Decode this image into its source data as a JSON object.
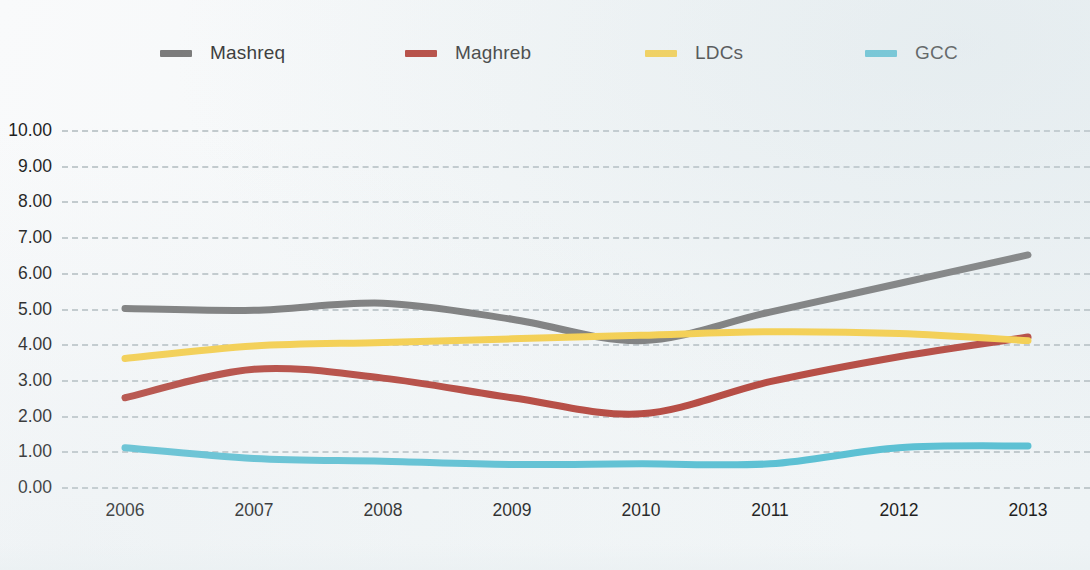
{
  "chart_data": {
    "type": "line",
    "title": "",
    "subtitle": "",
    "xlabel": "",
    "ylabel": "",
    "categories": [
      "2006",
      "2007",
      "2008",
      "2009",
      "2010",
      "2011",
      "2012",
      "2013"
    ],
    "x": [
      2006,
      2007,
      2008,
      2009,
      2010,
      2011,
      2012,
      2013
    ],
    "ylim": [
      0,
      10
    ],
    "ytick_labels": [
      "0.00",
      "1.00",
      "2.00",
      "3.00",
      "4.00",
      "5.00",
      "6.00",
      "7.00",
      "8.00",
      "9.00",
      "10.00"
    ],
    "ytick_values": [
      0,
      1,
      2,
      3,
      4,
      5,
      6,
      7,
      8,
      9,
      10
    ],
    "grid": true,
    "grid_style": "dashed-horizontal",
    "legend_position": "top",
    "series": [
      {
        "name": "Mashreq",
        "color": "#7b7b7b",
        "values": [
          5.0,
          4.95,
          5.15,
          4.7,
          4.1,
          4.9,
          5.7,
          6.5
        ]
      },
      {
        "name": "Maghreb",
        "color": "#b5453c",
        "values": [
          2.5,
          3.3,
          3.05,
          2.5,
          2.05,
          2.95,
          3.65,
          4.2
        ]
      },
      {
        "name": "LDCs",
        "color": "#f7cf4a",
        "values": [
          3.6,
          3.95,
          4.05,
          4.15,
          4.25,
          4.35,
          4.3,
          4.1
        ]
      },
      {
        "name": "GCC",
        "color": "#5bc0d3",
        "values": [
          1.1,
          0.8,
          0.72,
          0.63,
          0.65,
          0.65,
          1.1,
          1.15
        ]
      }
    ]
  },
  "legend": {
    "items": [
      {
        "label": "Mashreq",
        "color": "#7b7b7b"
      },
      {
        "label": "Maghreb",
        "color": "#b5453c"
      },
      {
        "label": "LDCs",
        "color": "#f7cf4a"
      },
      {
        "label": "GCC",
        "color": "#5bc0d3"
      }
    ]
  },
  "colors": {
    "background": "#f7f9fa",
    "gridline": "#b9c2c6",
    "axis_text": "#1f1f1f"
  }
}
